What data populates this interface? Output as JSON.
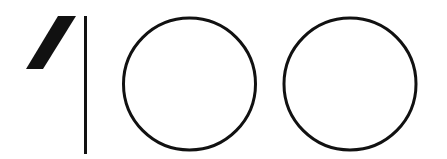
{
  "graphic": {
    "label": "100",
    "description": "Stylized numeral 100 logo mark",
    "colors": {
      "background": "#ffffff",
      "stroke": "#111111"
    },
    "glyphs": [
      {
        "char": "1",
        "type": "flag-and-stem"
      },
      {
        "char": "0",
        "type": "circle"
      },
      {
        "char": "0",
        "type": "circle"
      }
    ]
  }
}
